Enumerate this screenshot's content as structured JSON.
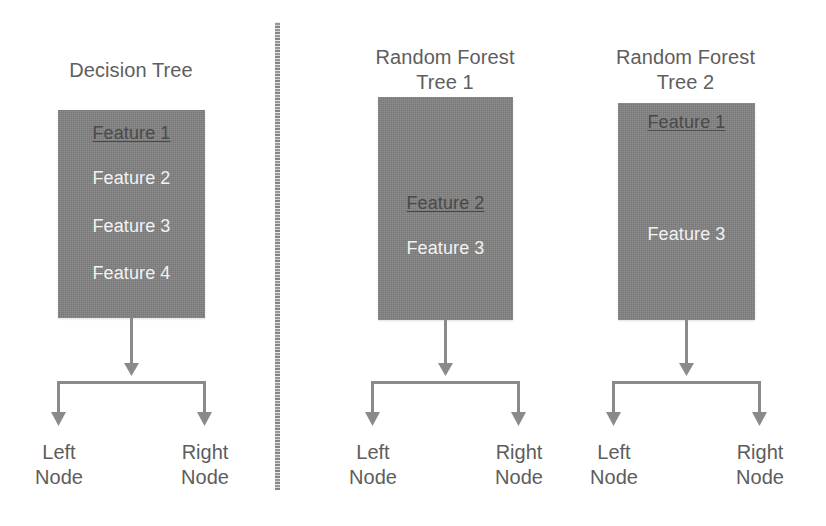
{
  "diagram": {
    "box_fill_color": "#818181",
    "selected_feature_color": "#4a4a4a",
    "plain_feature_color": "#f2f2f2",
    "title_text_color": "#5e5e5e",
    "arrow_color": "#8a8a8a",
    "background_color": "#ffffff"
  },
  "panels": [
    {
      "id": "decision-tree",
      "title": "Decision Tree",
      "features": [
        {
          "label": "Feature 1",
          "style": "selected",
          "top": 12
        },
        {
          "label": "Feature 2",
          "style": "plain",
          "top": 57
        },
        {
          "label": "Feature 3",
          "style": "plain",
          "top": 105
        },
        {
          "label": "Feature 4",
          "style": "plain",
          "top": 152
        }
      ],
      "leaves": [
        {
          "label": "Left\nNode"
        },
        {
          "label": "Right\nNode"
        }
      ]
    },
    {
      "id": "rf-tree-1",
      "title": "Random Forest\nTree 1",
      "features": [
        {
          "label": "Feature 2",
          "style": "selected",
          "top": 95
        },
        {
          "label": "Feature 3",
          "style": "plain",
          "top": 140
        }
      ],
      "leaves": [
        {
          "label": "Left\nNode"
        },
        {
          "label": "Right\nNode"
        }
      ]
    },
    {
      "id": "rf-tree-2",
      "title": "Random Forest\nTree 2",
      "features": [
        {
          "label": "Feature 1",
          "style": "selected",
          "top": 8
        },
        {
          "label": "Feature 3",
          "style": "plain",
          "top": 120
        }
      ],
      "leaves": [
        {
          "label": "Left\nNode"
        },
        {
          "label": "Right\nNode"
        }
      ]
    }
  ],
  "divider": {
    "name": "vertical-separator",
    "orientation": "vertical"
  }
}
